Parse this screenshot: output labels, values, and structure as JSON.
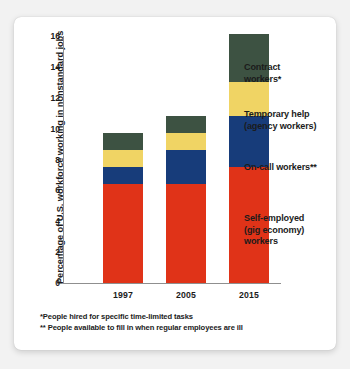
{
  "chart_data": {
    "type": "bar",
    "subtype": "stacked-bar",
    "title": "",
    "xlabel": "",
    "ylabel": "Percentage of U.S. workforce working in nonstandard jobs",
    "categories": [
      "1997",
      "2005",
      "2015"
    ],
    "ylim": [
      0,
      16
    ],
    "yticks": [
      0,
      2,
      4,
      6,
      8,
      10,
      12,
      14,
      16
    ],
    "ytick_labels": [
      "0",
      "2",
      "4",
      "6",
      "8",
      "10",
      "12",
      "14",
      "16"
    ],
    "grid": false,
    "legend_position": "right-inline-callouts",
    "stack_order_bottom_to_top": [
      "Self-employed (gig economy) workers",
      "On-call workers**",
      "Temporary help (agency workers)",
      "Contract workers*"
    ],
    "series": [
      {
        "name": "Self-employed (gig economy) workers",
        "color": "#e03318",
        "values": [
          6.4,
          6.4,
          7.5
        ]
      },
      {
        "name": "On-call workers**",
        "color": "#173c7a",
        "values": [
          1.1,
          2.2,
          3.3
        ]
      },
      {
        "name": "Temporary help (agency workers)",
        "color": "#f0d464",
        "values": [
          1.1,
          1.1,
          2.2
        ]
      },
      {
        "name": "Contract workers*",
        "color": "#3d5242",
        "values": [
          1.1,
          1.1,
          3.1
        ]
      }
    ],
    "totals": [
      9.7,
      10.8,
      16.1
    ],
    "annotations": [
      "*People hired for specific time-limited tasks",
      "** People available to fill in when regular employees are ill"
    ]
  },
  "axis": {
    "y_title": "Percentage of U.S. workforce working in nonstandard jobs",
    "y_ticks": [
      {
        "label": "16",
        "value": 16
      },
      {
        "label": "14",
        "value": 14
      },
      {
        "label": "12",
        "value": 12
      },
      {
        "label": "10",
        "value": 10
      },
      {
        "label": "8",
        "value": 8
      },
      {
        "label": "6",
        "value": 6
      },
      {
        "label": "4",
        "value": 4
      },
      {
        "label": "2",
        "value": 2
      },
      {
        "label": "0",
        "value": 0
      }
    ],
    "x_labels": [
      "1997",
      "2005",
      "2015"
    ]
  },
  "legend": {
    "items": [
      {
        "key": "contract",
        "line1": "Contract",
        "line2": "workers*",
        "color": "#3d5242"
      },
      {
        "key": "temporary",
        "line1": "Temporary help",
        "line2": "(agency workers)",
        "color": "#f0d464"
      },
      {
        "key": "oncall",
        "line1": "On-call workers**",
        "line2": "",
        "color": "#173c7a"
      },
      {
        "key": "selfemployed",
        "line1": "Self-employed",
        "line2": "(gig economy)",
        "line3": "workers",
        "color": "#e03318"
      }
    ]
  },
  "footnotes": {
    "first": "*People hired for specific time-limited tasks",
    "second": "** People available to fill in when regular employees are ill"
  },
  "colors": {
    "contract": "#3d5242",
    "temporary": "#f0d464",
    "oncall": "#173c7a",
    "selfemployed": "#e03318",
    "axis": "#8f8f8f",
    "text": "#1b1b1b",
    "card": "#ffffff",
    "page_background": "#f2f2f2"
  }
}
